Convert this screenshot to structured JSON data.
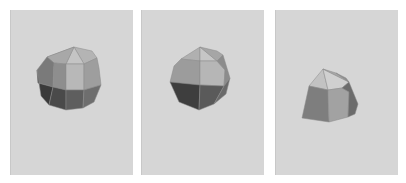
{
  "figure": {
    "panels": [
      {
        "id": "view-1",
        "left": 10,
        "width": 122,
        "background": "#d6d6d6",
        "faces": [
          {
            "points": "36,47 63,37 38,60",
            "fill": "#9a9a9a"
          },
          {
            "points": "63,37 81,41 86,48 73,54",
            "fill": "#b4b4b4"
          },
          {
            "points": "63,37 73,54 55,54",
            "fill": "#c4c4c4"
          },
          {
            "points": "63,37 55,54 43,53 36,47",
            "fill": "#a8a8a8"
          },
          {
            "points": "36,47 43,53 42,77 27,73 26,60",
            "fill": "#7a7a7a"
          },
          {
            "points": "43,53 55,54 55,80 42,77",
            "fill": "#8e8e8e"
          },
          {
            "points": "55,54 73,54 73,80 55,80",
            "fill": "#b8b8b8"
          },
          {
            "points": "73,54 86,48 88,58 90,75 73,80",
            "fill": "#9e9e9e"
          },
          {
            "points": "26,60 27,73 42,77 38,95 30,86",
            "fill": "#3a3a3a"
          },
          {
            "points": "42,77 55,80 55,100 38,95",
            "fill": "#4a4a4a"
          },
          {
            "points": "55,80 73,80 72,98 55,100",
            "fill": "#5e5e5e"
          },
          {
            "points": "73,80 90,75 83,92 72,98",
            "fill": "#6e6e6e"
          }
        ]
      },
      {
        "id": "view-2",
        "left": 141,
        "width": 122,
        "background": "#d6d6d6",
        "faces": [
          {
            "points": "58,37 39,49 58,51",
            "fill": "#b0b0b0"
          },
          {
            "points": "58,37 58,51 75,51",
            "fill": "#c6c6c6"
          },
          {
            "points": "58,37 75,41 81,45 75,51",
            "fill": "#a6a6a6"
          },
          {
            "points": "39,49 58,51 58,75 28,72 32,56",
            "fill": "#9c9c9c"
          },
          {
            "points": "58,51 75,51 83,60 82,76 58,75",
            "fill": "#b6b6b6"
          },
          {
            "points": "75,51 81,45 88,68 82,76 83,60",
            "fill": "#8c8c8c"
          },
          {
            "points": "28,72 58,75 57,100 37,92",
            "fill": "#3e3e3e"
          },
          {
            "points": "58,75 82,76 72,94 57,100",
            "fill": "#5a5a5a"
          },
          {
            "points": "82,76 88,68 84,84 72,94",
            "fill": "#6a6a6a"
          }
        ]
      },
      {
        "id": "view-3",
        "left": 275,
        "width": 122,
        "background": "#d6d6d6",
        "faces": [
          {
            "points": "47,59 33,76 52,80",
            "fill": "#c2c2c2"
          },
          {
            "points": "47,59 52,80 66,78 73,72",
            "fill": "#d0d0d0"
          },
          {
            "points": "47,59 60,63 73,72",
            "fill": "#a8a8a8"
          },
          {
            "points": "60,63 70,68 73,72",
            "fill": "#8e8e8e"
          },
          {
            "points": "33,76 52,80 53,112 26,108",
            "fill": "#7e7e7e"
          },
          {
            "points": "52,80 66,78 73,82 72,107 53,112",
            "fill": "#a2a2a2"
          },
          {
            "points": "66,78 73,72 82,94 79,104 72,107 73,82",
            "fill": "#6c6c6c"
          }
        ]
      }
    ]
  }
}
